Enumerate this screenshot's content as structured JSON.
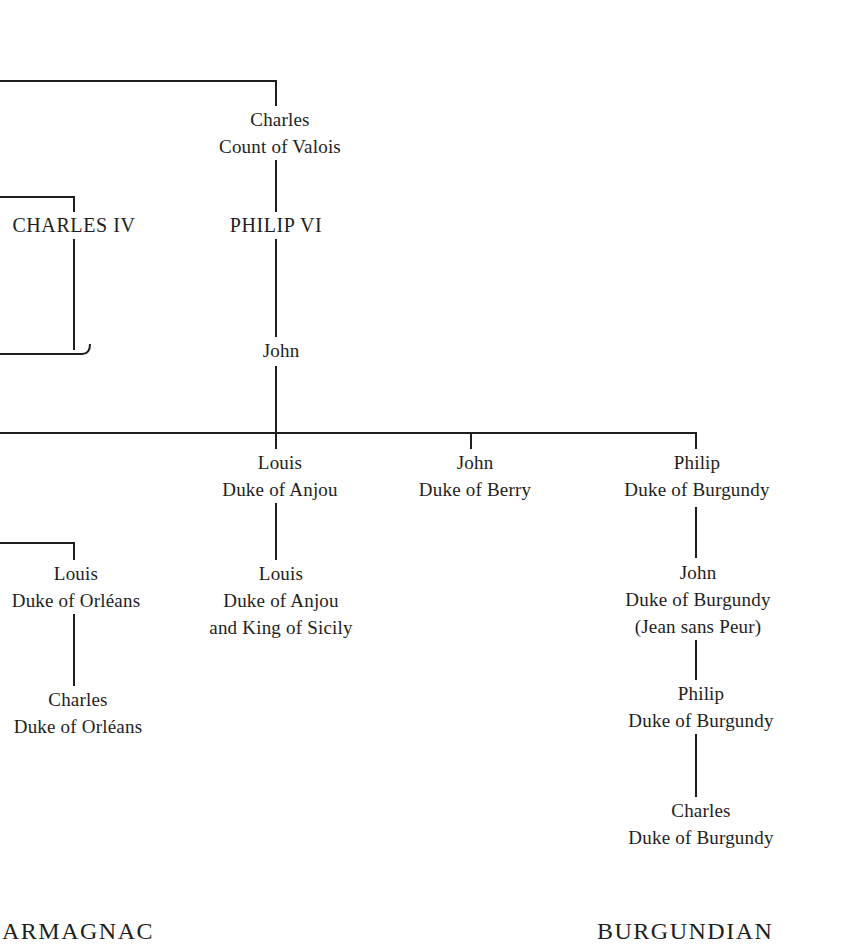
{
  "diagram": {
    "type": "family-tree",
    "nodes": [
      {
        "id": "charles-valois",
        "lines": [
          "Charles",
          "Count of Valois"
        ]
      },
      {
        "id": "charles-iv",
        "lines": [
          "CHARLES IV"
        ],
        "rank": "king"
      },
      {
        "id": "philip-vi",
        "lines": [
          "PHILIP VI"
        ],
        "rank": "king"
      },
      {
        "id": "john",
        "lines": [
          "John"
        ]
      },
      {
        "id": "louis-anjou",
        "lines": [
          "Louis",
          "Duke of Anjou"
        ]
      },
      {
        "id": "john-berry",
        "lines": [
          "John",
          "Duke of Berry"
        ]
      },
      {
        "id": "philip-burgundy",
        "lines": [
          "Philip",
          "Duke of Burgundy"
        ]
      },
      {
        "id": "louis-orleans",
        "lines": [
          "Louis",
          "Duke of Orléans"
        ]
      },
      {
        "id": "louis-anjou-sicily",
        "lines": [
          "Louis",
          "Duke of Anjou",
          "and King of Sicily"
        ]
      },
      {
        "id": "john-burgundy",
        "lines": [
          "John",
          "Duke of Burgundy",
          "(Jean sans Peur)"
        ]
      },
      {
        "id": "charles-orleans",
        "lines": [
          "Charles",
          "Duke of Orléans"
        ]
      },
      {
        "id": "philip-burgundy-2",
        "lines": [
          "Philip",
          "Duke of Burgundy"
        ]
      },
      {
        "id": "charles-burgundy",
        "lines": [
          "Charles",
          "Duke of Burgundy"
        ]
      }
    ],
    "edges": [
      [
        "charles-valois",
        "philip-vi"
      ],
      [
        "philip-vi",
        "john"
      ],
      [
        "john",
        "louis-anjou"
      ],
      [
        "john",
        "john-berry"
      ],
      [
        "john",
        "philip-burgundy"
      ],
      [
        "louis-anjou",
        "louis-anjou-sicily"
      ],
      [
        "philip-burgundy",
        "john-burgundy"
      ],
      [
        "john-burgundy",
        "philip-burgundy-2"
      ],
      [
        "philip-burgundy-2",
        "charles-burgundy"
      ],
      [
        "louis-orleans",
        "charles-orleans"
      ]
    ],
    "factions": {
      "left": "ARMAGNAC",
      "right": "BURGUNDIAN"
    },
    "line_color": "#1e1e1e"
  }
}
